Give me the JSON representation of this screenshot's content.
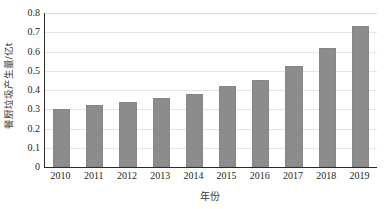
{
  "chart_data": {
    "type": "bar",
    "title": "",
    "categories": [
      "2010",
      "2011",
      "2012",
      "2013",
      "2014",
      "2015",
      "2016",
      "2017",
      "2018",
      "2019"
    ],
    "values": [
      0.3,
      0.32,
      0.34,
      0.36,
      0.38,
      0.42,
      0.45,
      0.525,
      0.62,
      0.73
    ],
    "xlabel": "年份",
    "ylabel": "餐厨垃圾产生量/亿t",
    "ylim": [
      0,
      0.8
    ],
    "yticks": [
      "0.8",
      "0.7",
      "0.6",
      "0.5",
      "0.4",
      "0.3",
      "0.2",
      "0.1",
      "0"
    ],
    "ytick_values": [
      0.8,
      0.7,
      0.6,
      0.5,
      0.4,
      0.3,
      0.2,
      0.1,
      0
    ],
    "grid": "horizontal",
    "legend": "none",
    "series": [
      {
        "name": "餐厨垃圾产生量",
        "color": "#8c8c8c",
        "values": [
          0.3,
          0.32,
          0.34,
          0.36,
          0.38,
          0.42,
          0.45,
          0.525,
          0.62,
          0.73
        ]
      }
    ],
    "colors": {
      "bar": "#8c8c8c",
      "grid": "#e4e4e4",
      "axis": "#2b2b2b",
      "background": "#ffffff",
      "text": "#231f20"
    }
  }
}
